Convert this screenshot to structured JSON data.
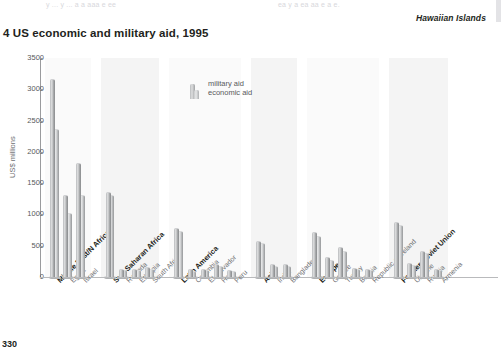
{
  "top_running_text": {
    "left": "y ... y ... a a aaa e ee",
    "right": "ea y a ea aa e a e."
  },
  "map_caption": "Hawaiian Islands",
  "page_number": "330",
  "chart_data": {
    "type": "bar",
    "title": "4 US economic and military aid, 1995",
    "xlabel": "",
    "ylabel": "US$ millions",
    "ylim": [
      0,
      3500
    ],
    "yticks": [
      0,
      500,
      1000,
      1500,
      2000,
      2500,
      3000,
      3500
    ],
    "ytick_labels": [
      "0",
      "500",
      "1000",
      "1500",
      "2000",
      "2500",
      "3000",
      "3500"
    ],
    "grid": false,
    "legend": {
      "position": "inside-top-center",
      "entries": [
        "military aid",
        "economic aid"
      ]
    },
    "series": [
      {
        "name": "military aid",
        "key": "military"
      },
      {
        "name": "economic aid",
        "key": "economic"
      }
    ],
    "groups": [
      {
        "name": "Middle East/N Africa",
        "is_region": true,
        "categories": [
          "Middle East/N Africa",
          "Egypt",
          "Israel"
        ],
        "region_flags": [
          true,
          false,
          false
        ],
        "military": [
          3150,
          1300,
          1800
        ],
        "economic": [
          2350,
          1000,
          1300
        ]
      },
      {
        "name": "Sub-Saharan Africa",
        "is_region": true,
        "categories": [
          "Sub-Saharan Africa",
          "Rwanda",
          "Ethiopia",
          "South Africa"
        ],
        "region_flags": [
          true,
          false,
          false,
          false
        ],
        "military": [
          1350,
          110,
          105,
          140
        ],
        "economic": [
          1300,
          95,
          90,
          120
        ]
      },
      {
        "name": "Latin America",
        "is_region": true,
        "categories": [
          "Latin America",
          "Colombia",
          "El Salvador",
          "Haiti",
          "Peru"
        ],
        "region_flags": [
          true,
          false,
          false,
          false,
          false
        ],
        "military": [
          760,
          105,
          115,
          190,
          95
        ],
        "economic": [
          720,
          85,
          95,
          160,
          80
        ]
      },
      {
        "name": "Asia",
        "is_region": true,
        "categories": [
          "Asia",
          "India",
          "Bangladesh"
        ],
        "region_flags": [
          true,
          false,
          false
        ],
        "military": [
          560,
          195,
          185
        ],
        "economic": [
          520,
          165,
          160
        ]
      },
      {
        "name": "Europe",
        "is_region": true,
        "categories": [
          "Europe",
          "Greece",
          "Turkey",
          "Bosnia",
          "Republic of Ireland"
        ],
        "region_flags": [
          true,
          false,
          false,
          false,
          false
        ],
        "military": [
          700,
          300,
          460,
          130,
          110
        ],
        "economic": [
          640,
          255,
          400,
          105,
          90
        ]
      },
      {
        "name": "Former Soviet Union",
        "is_region": true,
        "categories": [
          "Former Soviet Union",
          "Ukraine",
          "Russia",
          "Armenia"
        ],
        "region_flags": [
          true,
          false,
          false,
          false
        ],
        "military": [
          860,
          210,
          400,
          120
        ],
        "economic": [
          820,
          180,
          360,
          100
        ]
      }
    ],
    "colors": {
      "military_aid": "#b9bbbd",
      "economic_aid": "#c8cacb",
      "axis": "#9a9b9e",
      "text": "#58595b",
      "panel": "#fafafa"
    }
  }
}
